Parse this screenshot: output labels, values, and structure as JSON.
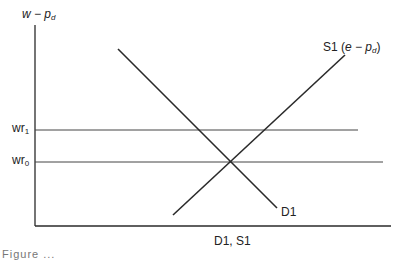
{
  "diagram": {
    "y_axis_label": {
      "main": "w − p",
      "sub": "d"
    },
    "x_axis_label": "D1, S1",
    "supply_curve_label": {
      "prefix": "S1 (",
      "main": "e − p",
      "sub": "d",
      "suffix": ")"
    },
    "demand_curve_label": "D1",
    "reference_lines": [
      {
        "label": "wr",
        "sub": "1"
      },
      {
        "label": "wr",
        "sub": "0"
      }
    ],
    "caption": "Figure ..."
  },
  "colors": {
    "line": "#2a2a2a",
    "background": "#ffffff"
  }
}
